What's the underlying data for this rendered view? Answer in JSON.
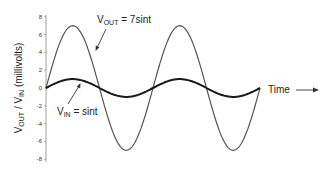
{
  "chart_data": {
    "type": "line",
    "title": "",
    "xlabel": "Time",
    "ylabel": "V_OUT / V_IN (millivolts)",
    "ylabel_parts": {
      "v1": "V",
      "s1": "OUT",
      "sep": " / ",
      "v2": "V",
      "s2": "IN",
      "tail": " (millivolts)"
    },
    "ylim": [
      -8,
      8
    ],
    "yticks": [
      8,
      6,
      4,
      2,
      0,
      -2,
      -4,
      -6,
      -8
    ],
    "x_domain": [
      0,
      12.566
    ],
    "grid": false,
    "legend": "none",
    "series": [
      {
        "name": "V_OUT = 7sint",
        "amplitude": 7,
        "function": "7*sin(t)",
        "color": "#555555",
        "stroke_width": 1.2
      },
      {
        "name": "V_IN = sint",
        "amplitude": 1,
        "function": "sin(t)",
        "color": "#1a1a1a",
        "stroke_width": 2
      }
    ],
    "annotations": [
      {
        "text_main": "V",
        "text_sub": "OUT",
        "text_rest": " = 7sint",
        "target_series": "V_OUT"
      },
      {
        "text_main": "V",
        "text_sub": "IN",
        "text_rest": " = sint",
        "target_series": "V_IN"
      },
      {
        "text": "Time",
        "arrow": "right"
      }
    ]
  },
  "layout": {
    "origin_x": 46,
    "zero_y": 88,
    "px_per_unit_y": 8.9,
    "period_px": 107,
    "periods": 2
  }
}
